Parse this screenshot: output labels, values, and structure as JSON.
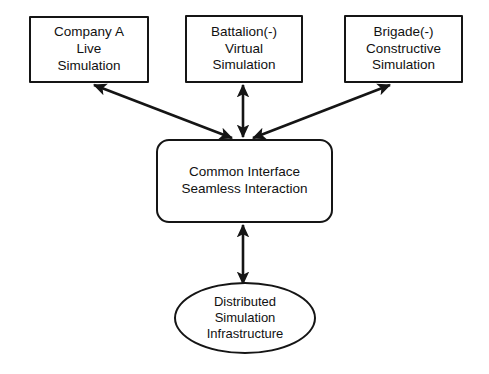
{
  "diagram": {
    "background_color": "#ffffff",
    "stroke_color": "#151515",
    "nodes": [
      {
        "id": "live",
        "shape": "rectangle",
        "lines": [
          "Company A",
          "Live",
          "Simulation"
        ]
      },
      {
        "id": "virtual",
        "shape": "rectangle",
        "lines": [
          "Battalion(-)",
          "Virtual",
          "Simulation"
        ]
      },
      {
        "id": "constructive",
        "shape": "rectangle",
        "lines": [
          "Brigade(-)",
          "Constructive",
          "Simulation"
        ]
      },
      {
        "id": "interface",
        "shape": "rounded-rectangle",
        "lines": [
          "Common Interface",
          "Seamless Interaction"
        ]
      },
      {
        "id": "infrastructure",
        "shape": "ellipse",
        "lines": [
          "Distributed",
          "Simulation",
          "Infrastructure"
        ]
      }
    ],
    "edges": [
      {
        "id": "interface-live",
        "from": "interface",
        "to": "live",
        "arrow": "double",
        "label": ""
      },
      {
        "id": "interface-virtual",
        "from": "interface",
        "to": "virtual",
        "arrow": "double",
        "label": ""
      },
      {
        "id": "interface-constructive",
        "from": "interface",
        "to": "constructive",
        "arrow": "double",
        "label": ""
      },
      {
        "id": "interface-infrastructure",
        "from": "interface",
        "to": "infrastructure",
        "arrow": "double",
        "label": ""
      }
    ]
  }
}
